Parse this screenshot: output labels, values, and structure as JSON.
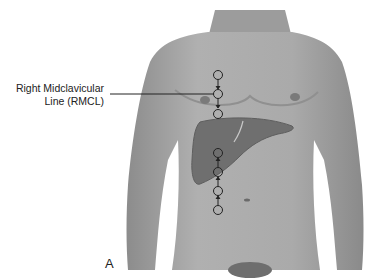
{
  "figure": {
    "panel_label": "A",
    "annotation": {
      "line1": "Right Midclavicular",
      "line2": "Line (RMCL)"
    },
    "markers_upper": 3,
    "markers_lower": 4,
    "colors": {
      "skin": "#a6a6a6",
      "skin_dark": "#8a8a8a",
      "liver": "#6f6f6f",
      "marker": "#222222",
      "background": "#ffffff"
    }
  }
}
